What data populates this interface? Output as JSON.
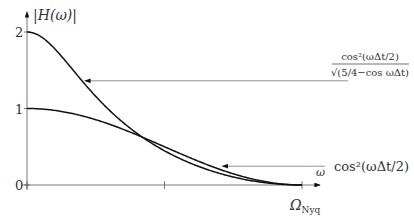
{
  "chart_data": {
    "type": "line",
    "title": "",
    "ylabel": "|H(ω)|",
    "xlabel": "ω",
    "xlim": [
      0,
      1
    ],
    "ylim": [
      0,
      2
    ],
    "x_ticks": [
      {
        "value": 0,
        "label": ""
      },
      {
        "value": 0.5,
        "label": ""
      },
      {
        "value": 1,
        "label": "Ω_Nyq"
      }
    ],
    "y_ticks": [
      {
        "value": 0,
        "label": "0"
      },
      {
        "value": 1,
        "label": "1"
      },
      {
        "value": 2,
        "label": "2"
      }
    ],
    "series": [
      {
        "name": "cos²(ωΔt/2)/√(5/4−cos ωΔt)",
        "formula": "cos^2(pi*x/2)/sqrt(5/4-cos(pi*x))"
      },
      {
        "name": "cos²(ωΔt/2)",
        "formula": "cos^2(pi*x/2)"
      }
    ],
    "annotations": [
      {
        "text_num": "cos²(ωΔt/2)",
        "text_den": "√(5/4−cos ωΔt)",
        "points_to_series": 0,
        "arrow_at_x": 0.2
      },
      {
        "text": "cos²(ωΔt/2)",
        "points_to_series": 1,
        "arrow_at_x": 0.7
      }
    ],
    "nyquist_label": "Ω",
    "nyquist_sub": "Nyq",
    "grid": false
  }
}
